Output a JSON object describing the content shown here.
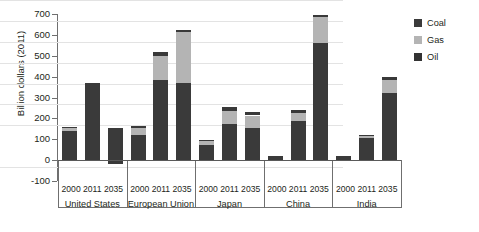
{
  "chart_data": {
    "type": "bar",
    "stacked": true,
    "title": "",
    "xlabel": "",
    "ylabel": "Billion dollars (2011)",
    "ylim": [
      -100,
      700
    ],
    "ytick_step": 100,
    "yticks": [
      700,
      600,
      500,
      400,
      300,
      200,
      100,
      0,
      -100
    ],
    "grid": true,
    "legend_position": "right",
    "legend": [
      "Coal",
      "Gas",
      "Oil"
    ],
    "series": [
      {
        "name": "Oil",
        "color": "#3a3a3a"
      },
      {
        "name": "Gas",
        "color": "#b4b4b4"
      },
      {
        "name": "Coal",
        "color": "#393939"
      }
    ],
    "groups": [
      {
        "name": "United States",
        "years": [
          "2000",
          "2011",
          "2035"
        ],
        "bars": [
          {
            "year": "2000",
            "oil": 140,
            "gas": 14,
            "coal": 4,
            "total": 158
          },
          {
            "year": "2011",
            "oil": 368,
            "gas": 0,
            "coal": 0,
            "total": 368
          },
          {
            "year": "2035",
            "oil": 155,
            "gas": 0,
            "coal": -20,
            "total": 135
          }
        ]
      },
      {
        "name": "European Union",
        "years": [
          "2000",
          "2011",
          "2035"
        ],
        "bars": [
          {
            "year": "2000",
            "oil": 122,
            "gas": 34,
            "coal": 6,
            "total": 162
          },
          {
            "year": "2011",
            "oil": 385,
            "gas": 113,
            "coal": 18,
            "total": 516
          },
          {
            "year": "2035",
            "oil": 368,
            "gas": 245,
            "coal": 9,
            "total": 622
          }
        ]
      },
      {
        "name": "Japan",
        "years": [
          "2000",
          "2011",
          "2035"
        ],
        "bars": [
          {
            "year": "2000",
            "oil": 72,
            "gas": 20,
            "coal": 6,
            "total": 98
          },
          {
            "year": "2011",
            "oil": 175,
            "gas": 62,
            "coal": 18,
            "total": 255
          },
          {
            "year": "2035",
            "oil": 152,
            "gas": 62,
            "coal": 16,
            "total": 230
          }
        ]
      },
      {
        "name": "China",
        "years": [
          "2000",
          "2011",
          "2035"
        ],
        "bars": [
          {
            "year": "2000",
            "oil": 18,
            "gas": 0,
            "coal": 0,
            "total": 18
          },
          {
            "year": "2011",
            "oil": 190,
            "gas": 38,
            "coal": 14,
            "total": 242
          },
          {
            "year": "2035",
            "oil": 560,
            "gas": 125,
            "coal": 10,
            "total": 695
          }
        ]
      },
      {
        "name": "India",
        "years": [
          "2000",
          "2011",
          "2035"
        ],
        "bars": [
          {
            "year": "2000",
            "oil": 22,
            "gas": 0,
            "coal": 0,
            "total": 22
          },
          {
            "year": "2011",
            "oil": 105,
            "gas": 14,
            "coal": 4,
            "total": 123
          },
          {
            "year": "2035",
            "oil": 320,
            "gas": 65,
            "coal": 15,
            "total": 400
          }
        ]
      }
    ]
  }
}
